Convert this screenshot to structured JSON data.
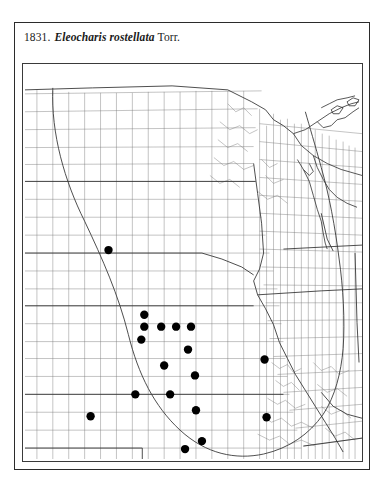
{
  "plate": {
    "number": "1831.",
    "scientific_name": "Eleocharis rostellata",
    "authority": "Torr."
  },
  "map": {
    "kind": "county-level species distribution dot map",
    "region": "north-central United States",
    "dot_color": "#000000",
    "county_line_color": "#7a7a7a",
    "state_line_color": "#2e2e2e",
    "range_line_color": "#3a3a3a",
    "background_color": "#ffffff",
    "dot_count": 23,
    "dot_radius": 4.2,
    "occurrence_dots": [
      {
        "x": 86,
        "y": 187
      },
      {
        "x": 122,
        "y": 252
      },
      {
        "x": 122,
        "y": 264
      },
      {
        "x": 139,
        "y": 264
      },
      {
        "x": 154,
        "y": 264
      },
      {
        "x": 169,
        "y": 264
      },
      {
        "x": 119,
        "y": 277
      },
      {
        "x": 166,
        "y": 287
      },
      {
        "x": 142,
        "y": 303
      },
      {
        "x": 173,
        "y": 313
      },
      {
        "x": 113,
        "y": 332
      },
      {
        "x": 148,
        "y": 332
      },
      {
        "x": 174,
        "y": 348
      },
      {
        "x": 245,
        "y": 355
      },
      {
        "x": 68,
        "y": 354
      },
      {
        "x": 180,
        "y": 379
      },
      {
        "x": 163,
        "y": 387
      },
      {
        "x": 146,
        "y": 414
      },
      {
        "x": 163,
        "y": 416
      },
      {
        "x": 203,
        "y": 412
      },
      {
        "x": 115,
        "y": 425
      },
      {
        "x": 138,
        "y": 455
      },
      {
        "x": 243,
        "y": 297
      }
    ]
  }
}
